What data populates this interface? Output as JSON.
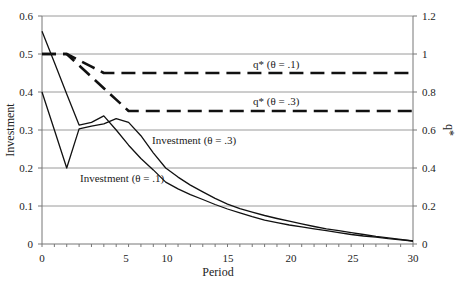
{
  "chart_data": {
    "type": "line",
    "title": "",
    "xlabel": "Period",
    "ylabel": "Investment",
    "y2label": "q*",
    "x": [
      0,
      1,
      2,
      3,
      4,
      5,
      6,
      7,
      8,
      9,
      10,
      11,
      12,
      13,
      14,
      15,
      16,
      17,
      18,
      19,
      20,
      21,
      22,
      23,
      24,
      25,
      26,
      27,
      28,
      29,
      30
    ],
    "x_tick_labels": [
      {
        "label": "0",
        "px": 42
      },
      {
        "label": "5",
        "px": 126
      },
      {
        "label": "10",
        "px": 167
      },
      {
        "label": "15",
        "px": 228
      },
      {
        "label": "20",
        "px": 291
      },
      {
        "label": "25",
        "px": 353
      },
      {
        "label": "30",
        "px": 413
      }
    ],
    "ylim": [
      0,
      0.6
    ],
    "yticks": [
      "0",
      "0.1",
      "0.2",
      "0.3",
      "0.4",
      "0.5",
      "0.6"
    ],
    "y2lim": [
      0,
      1.2
    ],
    "y2ticks": [
      "0",
      "0.2",
      "0.4",
      "0.6",
      "0.8",
      "1",
      "1.2"
    ],
    "grid": true,
    "series": [
      {
        "name": "Investment (θ = .1)",
        "axis": "left",
        "style": "solid",
        "values": [
          0.56,
          0.478,
          0.395,
          0.313,
          0.32,
          0.337,
          0.3,
          0.26,
          0.225,
          0.195,
          0.163,
          0.145,
          0.13,
          0.117,
          0.104,
          0.092,
          0.082,
          0.072,
          0.063,
          0.056,
          0.05,
          0.045,
          0.04,
          0.035,
          0.03,
          0.025,
          0.021,
          0.018,
          0.014,
          0.011,
          0.008
        ]
      },
      {
        "name": "Investment (θ = .3)",
        "axis": "left",
        "style": "solid",
        "values": [
          0.4,
          0.3,
          0.2,
          0.303,
          0.31,
          0.316,
          0.33,
          0.32,
          0.285,
          0.24,
          0.2,
          0.176,
          0.155,
          0.137,
          0.12,
          0.105,
          0.093,
          0.084,
          0.075,
          0.067,
          0.06,
          0.053,
          0.046,
          0.04,
          0.035,
          0.03,
          0.025,
          0.02,
          0.016,
          0.012,
          0.008
        ]
      },
      {
        "name": "q* (θ = .1)",
        "axis": "right",
        "style": "dashed",
        "values": [
          1,
          1,
          1,
          0.967,
          0.933,
          0.9,
          0.9,
          0.9,
          0.9,
          0.9,
          0.9,
          0.9,
          0.9,
          0.9,
          0.9,
          0.9,
          0.9,
          0.9,
          0.9,
          0.9,
          0.9,
          0.9,
          0.9,
          0.9,
          0.9,
          0.9,
          0.9,
          0.9,
          0.9,
          0.9,
          0.9
        ]
      },
      {
        "name": "q* (θ = .3)",
        "axis": "right",
        "style": "dashed",
        "values": [
          1,
          1,
          1,
          0.94,
          0.88,
          0.82,
          0.76,
          0.7,
          0.7,
          0.7,
          0.7,
          0.7,
          0.7,
          0.7,
          0.7,
          0.7,
          0.7,
          0.7,
          0.7,
          0.7,
          0.7,
          0.7,
          0.7,
          0.7,
          0.7,
          0.7,
          0.7,
          0.7,
          0.7,
          0.7,
          0.7
        ]
      }
    ],
    "annotations": [
      {
        "text": "q* (θ = .1)",
        "px": 253,
        "py": 68
      },
      {
        "text": "q* (θ = .3)",
        "px": 253,
        "py": 105
      },
      {
        "text": "Investment (θ = .3)",
        "px": 152,
        "py": 144
      },
      {
        "text": "Investment (θ = .1)",
        "px": 80,
        "py": 182
      }
    ]
  }
}
